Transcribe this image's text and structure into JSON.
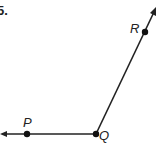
{
  "problem": {
    "number": "5."
  },
  "diagram": {
    "type": "angle",
    "vertex": "Q",
    "rays": [
      "QP",
      "QR"
    ],
    "points": [
      {
        "label": "P",
        "x": 27,
        "y": 134
      },
      {
        "label": "Q",
        "x": 96,
        "y": 134
      },
      {
        "label": "R",
        "x": 145,
        "y": 32
      }
    ],
    "line_color": "#222222"
  }
}
